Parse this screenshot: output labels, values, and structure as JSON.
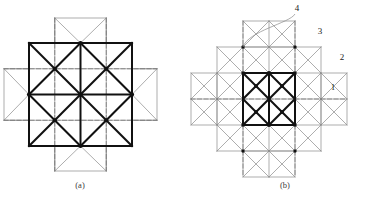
{
  "figure": {
    "panels": [
      {
        "id": "panel-a",
        "caption": "(a)",
        "caption_x": 80,
        "caption_y": 188,
        "description": "Square tile arrangement with bold 2x2 core grid and four outer flaps",
        "geometry": {
          "origin_x": 29,
          "origin_y": 43,
          "cell": 51.5,
          "cols": 2,
          "rows": 2,
          "flap_depth": 25
        },
        "labels": []
      },
      {
        "id": "panel-b",
        "caption": "(b)",
        "caption_x": 285,
        "caption_y": 188,
        "description": "Larger 4x4 triangulated grid with bold 2x1 core rectangle, flaps and numbered callouts",
        "geometry": {
          "origin_x": 217,
          "origin_y": 47,
          "cell": 26,
          "cols": 4,
          "rows": 4,
          "flap_depth": 26,
          "bold_col_start": 1,
          "bold_col_end": 3,
          "bold_row_start": 1,
          "bold_row_end": 3
        },
        "labels": [
          {
            "text": "4",
            "x": 297,
            "y": 11,
            "leader": true
          },
          {
            "text": "3",
            "x": 320,
            "y": 34
          },
          {
            "text": "2",
            "x": 342,
            "y": 60
          },
          {
            "text": "1",
            "x": 333,
            "y": 90
          }
        ]
      }
    ],
    "colors": {
      "thin_line": "#8a8a8a",
      "bold_line": "#111111",
      "dashed_line": "#6e6e6e",
      "node_fill": "#111111",
      "label_text": "#1a1a1a",
      "caption_text": "#3a3a3a",
      "background": "#ffffff"
    },
    "stroke_widths": {
      "thin": 0.7,
      "bold": 2.0,
      "dashed": 0.7
    },
    "dash_pattern": "4,2.5"
  }
}
